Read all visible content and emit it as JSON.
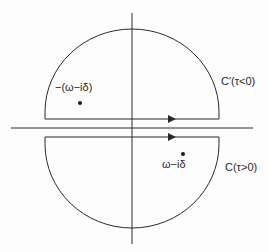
{
  "diagram": {
    "type": "contour-integration-plane",
    "colors": {
      "stroke": "#2a2a2a",
      "background": "#fdfdfd"
    },
    "axes": {
      "horizontal": {
        "x1": 11,
        "x2": 253,
        "y": 128
      },
      "vertical": {
        "x": 132,
        "y1": 13,
        "y2": 244
      }
    },
    "contours": [
      {
        "name": "C'",
        "label": "C′(τ<0)",
        "half": "upper",
        "direction": "right"
      },
      {
        "name": "C",
        "label": "C(τ>0)",
        "half": "lower",
        "direction": "right"
      }
    ],
    "poles": [
      {
        "label": "−(ω−iδ)",
        "position": "upper-left"
      },
      {
        "label": "ω−iδ",
        "position": "lower-right"
      }
    ]
  }
}
